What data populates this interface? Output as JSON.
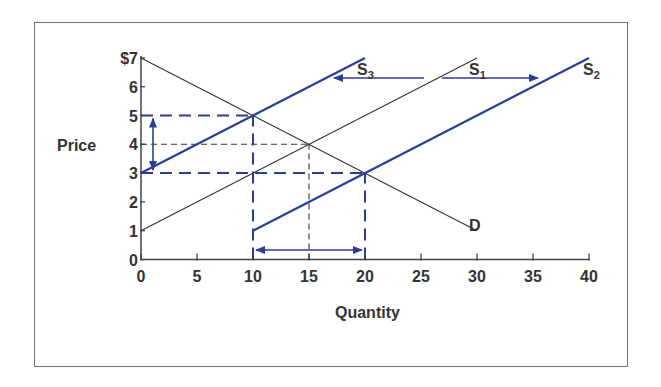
{
  "chart_data": {
    "type": "line",
    "title": "",
    "xlabel": "Quantity",
    "ylabel": "Price",
    "xlim": [
      0,
      40
    ],
    "ylim": [
      0,
      7
    ],
    "x_ticks": [
      "0",
      "5",
      "10",
      "15",
      "20",
      "25",
      "30",
      "35",
      "40"
    ],
    "y_ticks": [
      "0",
      "1",
      "2",
      "3",
      "4",
      "5",
      "6",
      "$7"
    ],
    "grid": false,
    "series": [
      {
        "name": "D",
        "role": "demand",
        "color": "#333333",
        "points": [
          [
            0,
            7
          ],
          [
            30,
            1
          ]
        ]
      },
      {
        "name": "S1",
        "role": "original supply",
        "color": "#333333",
        "points": [
          [
            0,
            1
          ],
          [
            30,
            7
          ]
        ]
      },
      {
        "name": "S2",
        "role": "supply increase",
        "color": "#2b3c9a",
        "points": [
          [
            10,
            1
          ],
          [
            40,
            7
          ]
        ]
      },
      {
        "name": "S3",
        "role": "supply decrease",
        "color": "#2b3c9a",
        "points": [
          [
            0,
            3
          ],
          [
            20,
            7
          ]
        ]
      }
    ],
    "reference_lines": [
      {
        "type": "horizontal",
        "y": 5,
        "x_to": 10,
        "style": "dashed",
        "color": "#2b3c9a"
      },
      {
        "type": "horizontal",
        "y": 3,
        "x_to": 20,
        "style": "dashed",
        "color": "#2b3c9a"
      },
      {
        "type": "horizontal",
        "y": 4,
        "x_to": 15,
        "style": "dashed",
        "color": "#333333"
      },
      {
        "type": "vertical",
        "x": 10,
        "y_to": 5,
        "style": "dashed",
        "color": "#2b3c9a"
      },
      {
        "type": "vertical",
        "x": 20,
        "y_to": 3,
        "style": "dashed",
        "color": "#2b3c9a"
      },
      {
        "type": "vertical",
        "x": 15,
        "y_to": 4,
        "style": "dashed",
        "color": "#333333"
      }
    ],
    "equilibria": [
      {
        "curve": "S1",
        "quantity": 15,
        "price": 4
      },
      {
        "curve": "S3",
        "quantity": 10,
        "price": 5
      },
      {
        "curve": "S2",
        "quantity": 20,
        "price": 3
      }
    ],
    "annotations": [
      {
        "type": "arrow",
        "direction": "left",
        "meaning": "shift S1 to S3",
        "at_price": 6.3
      },
      {
        "type": "arrow",
        "direction": "right",
        "meaning": "shift S1 to S2",
        "at_price": 6.3
      },
      {
        "type": "double-arrow",
        "direction": "vertical",
        "from_price": 3,
        "to_price": 5,
        "at_quantity": 1
      },
      {
        "type": "double-arrow",
        "direction": "horizontal",
        "from_quantity": 10,
        "to_quantity": 20,
        "at_price": 0.35
      }
    ]
  },
  "labels": {
    "x_axis_title": "Quantity",
    "y_axis_title": "Price",
    "curve_D": "D",
    "curve_S": "S",
    "sub_1": "1",
    "sub_2": "2",
    "sub_3": "3"
  },
  "colors": {
    "blue": "#2b3c9a",
    "dark": "#333333"
  }
}
